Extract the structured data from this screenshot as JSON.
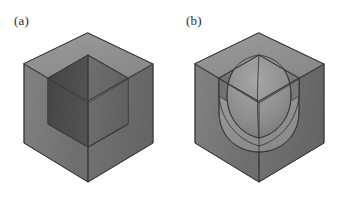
{
  "figure": {
    "background_color": "#ffffff",
    "panel_count": 2,
    "panels": [
      {
        "id": "a",
        "label": "(a)",
        "description": "cube with sharp square interior corner pocket",
        "corner_type": "sharp",
        "fillet_radius": 0
      },
      {
        "id": "b",
        "label": "(b)",
        "description": "cube with filleted rounded interior corner pocket",
        "corner_type": "filleted",
        "fillet_radius": 1
      }
    ]
  },
  "colors": {
    "background": "#ffffff",
    "outline": "#3a3a3a",
    "top_rim": "#8e8e8e",
    "outer_left_wall": "#777777",
    "outer_right_wall": "#6d6d6d",
    "inner_left_wall": "#4a4a4a",
    "inner_right_wall": "#686868",
    "inner_floor": "#8d8d8d",
    "fillet_surface_light": "#9a9a9a",
    "fillet_surface_dark": "#6a6a6a",
    "label_text": "#2b2b2b"
  },
  "geometry": {
    "note": "isometric projection; coordinates in panel-local pixels (171x198 viewBox)",
    "outer_hexagon": {
      "top": [
        88,
        33
      ],
      "upper_right": [
        153,
        64
      ],
      "lower_right": [
        153,
        143
      ],
      "bottom": [
        88,
        182
      ],
      "lower_left": [
        24,
        143
      ],
      "upper_left": [
        24,
        64
      ]
    },
    "inner_pocket": {
      "center_top": [
        88,
        62
      ],
      "inner_corner": [
        88,
        137
      ],
      "left_inner_top": [
        48,
        78
      ],
      "right_inner_top": [
        128,
        78
      ],
      "left_inner_bottom": [
        48,
        124
      ],
      "right_inner_bottom": [
        128,
        124
      ]
    },
    "wall_thickness_px": 14
  }
}
